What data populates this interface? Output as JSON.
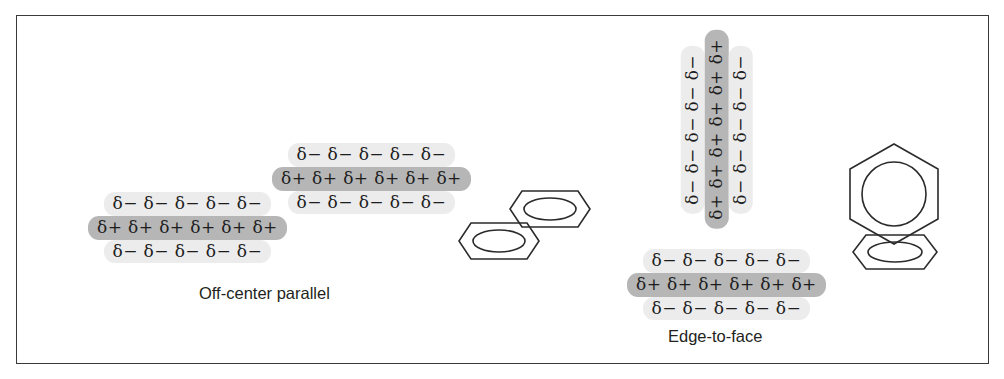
{
  "figure": {
    "background_color": "#ffffff",
    "border_color": "#3a3a3a",
    "highlight_negative_color": "#ececec",
    "highlight_positive_color": "#b6b6b6",
    "stroke_color": "#2b2b2b"
  },
  "captions": {
    "off_center_parallel": "Off-center parallel",
    "edge_to_face": "Edge-to-face"
  },
  "quadrupole_stacks": {
    "off_center_upper": {
      "rows": [
        {
          "sign": "negative",
          "text": "δ− δ− δ− δ− δ−"
        },
        {
          "sign": "positive",
          "text": "δ+ δ+ δ+ δ+ δ+ δ+"
        },
        {
          "sign": "negative",
          "text": "δ− δ− δ− δ− δ−"
        }
      ]
    },
    "off_center_lower": {
      "rows": [
        {
          "sign": "negative",
          "text": "δ− δ− δ− δ− δ−"
        },
        {
          "sign": "positive",
          "text": "δ+ δ+ δ+ δ+ δ+ δ+"
        },
        {
          "sign": "negative",
          "text": "δ− δ− δ− δ− δ−"
        }
      ]
    },
    "edge_to_face_vertical": {
      "columns": [
        {
          "sign": "negative",
          "text": "δ− δ− δ− δ− δ−"
        },
        {
          "sign": "positive",
          "text": "δ+ δ+ δ+ δ+ δ+ δ+"
        },
        {
          "sign": "negative",
          "text": "δ− δ− δ− δ− δ−"
        }
      ]
    },
    "edge_to_face_horizontal": {
      "rows": [
        {
          "sign": "negative",
          "text": "δ− δ− δ− δ− δ−"
        },
        {
          "sign": "positive",
          "text": "δ+ δ+ δ+ δ+ δ+ δ+"
        },
        {
          "sign": "negative",
          "text": "δ− δ− δ− δ− δ−"
        }
      ]
    }
  },
  "rings": {
    "off_center_upper_ring": {
      "orientation": "edge-on",
      "label": "benzene-ring"
    },
    "off_center_lower_ring": {
      "orientation": "edge-on",
      "label": "benzene-ring"
    },
    "edge_to_face_upper_ring": {
      "orientation": "face-on",
      "label": "benzene-ring"
    },
    "edge_to_face_lower_ring": {
      "orientation": "edge-on",
      "label": "benzene-ring"
    }
  }
}
